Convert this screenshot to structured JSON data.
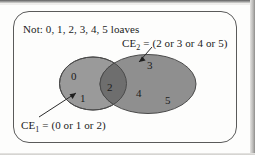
{
  "figure": {
    "universe_label": "Not: 0, 1, 2, 3, 4, 5 loaves",
    "callouts": {
      "ce1": {
        "name": "CE",
        "subscript": "1",
        "equals": " = (0 or 1 or 2)",
        "full_text": "CE1 = (0 or 1 or 2)"
      },
      "ce2": {
        "name": "CE",
        "subscript": "2",
        "equals": " = (2 or 3 or 4 or 5)",
        "full_text": "CE2 = (2 or 3 or 4 or 5)"
      }
    },
    "regions": [
      {
        "label": "0",
        "set": "ce1-only"
      },
      {
        "label": "1",
        "set": "ce1-only"
      },
      {
        "label": "2",
        "set": "intersection"
      },
      {
        "label": "3",
        "set": "ce2-only"
      },
      {
        "label": "4",
        "set": "ce2-only"
      },
      {
        "label": "5",
        "set": "ce2-only"
      }
    ],
    "colors": {
      "left_ellipse_fill": "#9a9a9a",
      "right_ellipse_fill": "#8f8f8f",
      "overlap_fill": "#6e6e6e",
      "ellipse_stroke": "#4a4a4a",
      "frame_stroke": "#5a5a5a",
      "text": "#1b1b1b",
      "page_background": "#fdfdfc"
    }
  }
}
